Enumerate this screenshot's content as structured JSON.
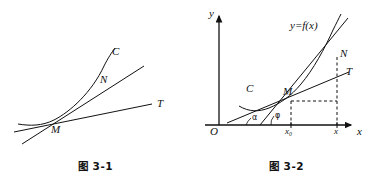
{
  "page": {
    "background": "#ffffff",
    "ink": "#111111",
    "width": 382,
    "height": 187
  },
  "figures": [
    {
      "id": "figure-1",
      "caption": "图 3-1",
      "description": "Curve C with secant line through M and N, and tangent line MT at point M",
      "labels": {
        "curve": "C",
        "point_m": "M",
        "point_n": "N",
        "tangent": "T"
      },
      "label_positions": {
        "curve": {
          "x": 112,
          "y": 52
        },
        "point_n": {
          "x": 101,
          "y": 80
        },
        "point_m": {
          "x": 52,
          "y": 129
        },
        "tangent": {
          "x": 157,
          "y": 104
        }
      },
      "geometry": {
        "point_m": {
          "x": 51,
          "y": 124
        },
        "point_n": {
          "x": 111,
          "y": 88
        },
        "curve_path": "M 18,124 C 30,126 42,126 54,120 C 70,112 92,92 104,66 C 108,58 112,52 115,48",
        "secant_path": "M 22,144 L 144,66",
        "tangent_path": "M 14,132 L 152,104"
      }
    },
    {
      "id": "figure-2",
      "caption": "图 3-2",
      "description": "Cartesian axes with curve y=f(x), secant MN, tangent MT, angles alpha and phi at x-axis",
      "labels": {
        "y_axis": "y",
        "x_axis": "x",
        "origin": "O",
        "function": "y=f(x)",
        "curve": "C",
        "point_m": "M",
        "point_n": "N",
        "tangent": "T",
        "angle_alpha": "α",
        "angle_phi": "φ",
        "tick_x0": "x₀",
        "tick_x": "x"
      },
      "label_positions": {
        "y_axis": {
          "x": 32,
          "y": 8
        },
        "x_axis": {
          "x": 163,
          "y": 131
        },
        "origin": {
          "x": 25,
          "y": 130
        },
        "function": {
          "x": 101,
          "y": 26
        },
        "curve": {
          "x": 57,
          "y": 88
        },
        "point_m": {
          "x": 95,
          "y": 90
        },
        "point_n": {
          "x": 150,
          "y": 52
        },
        "tangent": {
          "x": 155,
          "y": 74
        },
        "angle_alpha": {
          "x": 44,
          "y": 116
        },
        "angle_phi": {
          "x": 76,
          "y": 114
        },
        "tick_x0": {
          "x": 95,
          "y": 130
        },
        "tick_x": {
          "x": 141,
          "y": 130
        }
      },
      "geometry": {
        "axis_origin": {
          "x": 28,
          "y": 125
        },
        "y_axis_top": {
          "x": 28,
          "y": 14
        },
        "x_axis_right": {
          "x": 162,
          "y": 125
        },
        "point_m": {
          "x": 100,
          "y": 100
        },
        "point_n": {
          "x": 146,
          "y": 56
        },
        "x0_tick": {
          "x": 100,
          "y": 125
        },
        "x_tick": {
          "x": 146,
          "y": 125
        },
        "curve_path": "M 48,106 C 58,112 68,112 78,108 C 90,103 100,96 110,84 C 122,70 134,48 142,30 C 145,24 148,18 150,14",
        "secant_path": "M 69,125 L 157,18",
        "tangent_path": "M 36,123 L 158,72",
        "alpha_arc": "M 56,125 A 20,20 0 0 1 62,119",
        "phi_arc": "M 80,125 A 12,12 0 0 1 84,117",
        "dash_vertical_m": "M 100,101 L 100,125",
        "dash_vertical_n": "M 146,57 L 146,125",
        "dash_horizontal": "M 100,101 L 146,101"
      }
    }
  ]
}
